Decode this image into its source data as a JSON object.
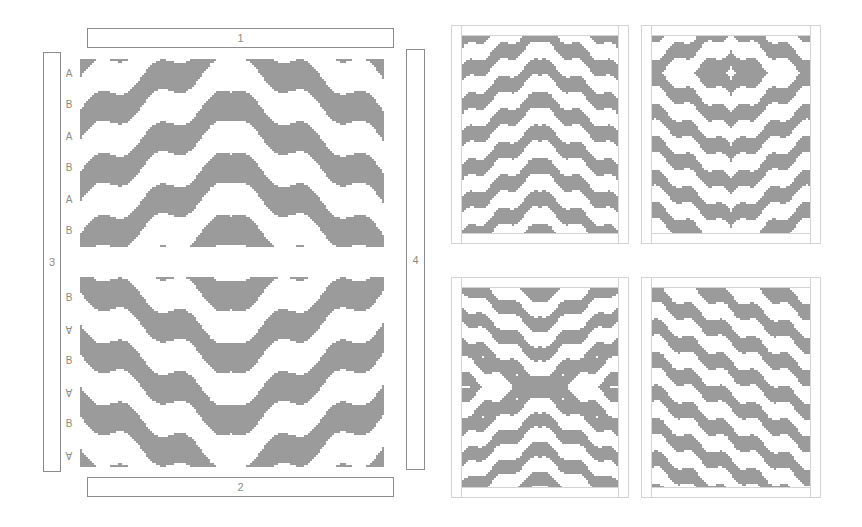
{
  "diagram": {
    "fill_color": "#9b9b9b",
    "line_color": "#8c8c8c",
    "frame_color": "#d4d4d4",
    "main_quilt": {
      "borders": {
        "top": "1",
        "bottom": "2",
        "left": "3",
        "right": "4"
      },
      "row_labels_top_half": [
        "A",
        "B",
        "A",
        "B",
        "A",
        "B"
      ],
      "row_labels_bottom_half": [
        "B",
        "A",
        "B",
        "A",
        "B",
        "A"
      ],
      "bottom_half_labels_rotated": [
        false,
        true,
        false,
        true,
        false,
        true
      ],
      "top_half_pattern": "chevrons-up",
      "bottom_half_pattern": "chevrons-down"
    },
    "layout_variations": [
      {
        "id": "variation-1",
        "pattern": "stacked-chevrons-up"
      },
      {
        "id": "variation-2",
        "pattern": "concentric-diamond-over-chevrons"
      },
      {
        "id": "variation-3",
        "pattern": "x-cross"
      },
      {
        "id": "variation-4",
        "pattern": "diagonal-stripes"
      }
    ]
  }
}
